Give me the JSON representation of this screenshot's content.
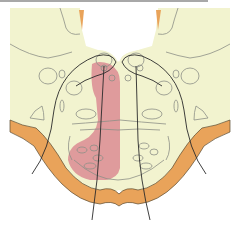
{
  "figure": {
    "type": "anatomical-cross-section",
    "colors": {
      "tissue": "#f2f3cf",
      "outer_band": "#e9a35a",
      "lesion": "#d9848f",
      "thin_outline": "#8d8f86",
      "dark_line": "#2a2a2a",
      "background": "#ffffff",
      "top_rule": "#a8a8a8"
    },
    "labels": []
  }
}
